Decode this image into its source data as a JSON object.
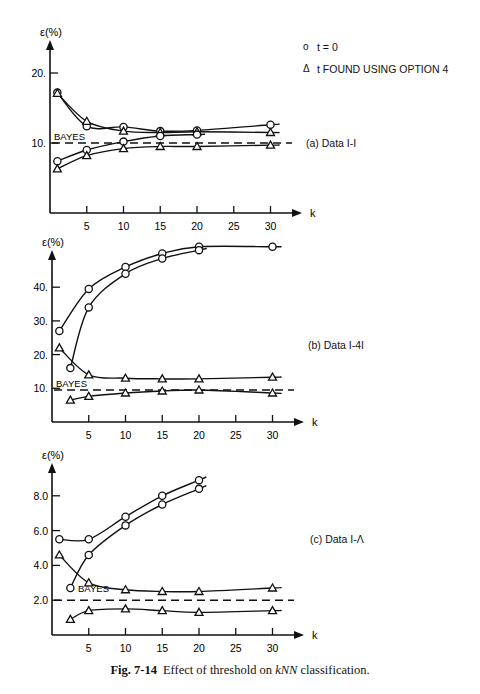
{
  "legend": {
    "items": [
      {
        "symbol": "o",
        "label": "t = 0"
      },
      {
        "symbol": "Δ",
        "label": "t FOUND USING OPTION 4"
      }
    ]
  },
  "caption": {
    "fig": "Fig. 7-14",
    "text_before": "Effect of threshold on ",
    "text_italic": "kNN",
    "text_after": " classification."
  },
  "chart_data": [
    {
      "type": "line",
      "title": "(a) Data I-I",
      "xlabel": "k",
      "ylabel": "ε(%)",
      "xticks": [
        5,
        10,
        15,
        20,
        25,
        30
      ],
      "yticks": [
        10,
        20
      ],
      "ytick_labels": [
        "10.",
        "20."
      ],
      "xlim": [
        0,
        32
      ],
      "ylim": [
        0,
        24
      ],
      "bayes": {
        "label": "BAYES",
        "value": 10
      },
      "grid": false,
      "series": [
        {
          "name": "t = 0 (upper)",
          "marker": "circle",
          "x": [
            1,
            5,
            10,
            15,
            20,
            30
          ],
          "y": [
            17.2,
            12.4,
            12.3,
            11.7,
            11.8,
            12.6
          ]
        },
        {
          "name": "t FOUND USING OPTION 4 (upper)",
          "marker": "triangle",
          "x": [
            1,
            5,
            10,
            15,
            20,
            30
          ],
          "y": [
            17.1,
            13.1,
            11.7,
            11.5,
            11.6,
            11.5
          ]
        },
        {
          "name": "t = 0 (lower)",
          "marker": "circle",
          "x": [
            1,
            5,
            10,
            15,
            20
          ],
          "y": [
            7.4,
            9.0,
            10.2,
            11.0,
            11.2
          ]
        },
        {
          "name": "t FOUND USING OPTION 4 (lower)",
          "marker": "triangle",
          "x": [
            1,
            5,
            10,
            15,
            20,
            30
          ],
          "y": [
            6.3,
            8.2,
            9.2,
            9.5,
            9.5,
            9.7
          ]
        }
      ]
    },
    {
      "type": "line",
      "title": "(b) Data I-4I",
      "xlabel": "k",
      "ylabel": "ε(%)",
      "xticks": [
        5,
        10,
        15,
        20,
        25,
        30
      ],
      "yticks": [
        10,
        20,
        30,
        40
      ],
      "ytick_labels": [
        "10.",
        "20.",
        "30.",
        "40."
      ],
      "xlim": [
        0,
        32
      ],
      "ylim": [
        0,
        56
      ],
      "bayes": {
        "label": "BAYES",
        "value": 9.5
      },
      "grid": false,
      "series": [
        {
          "name": "t = 0 (upper)",
          "marker": "circle",
          "x": [
            1,
            5,
            10,
            15,
            20,
            30
          ],
          "y": [
            27,
            39.5,
            46,
            50,
            52,
            52
          ]
        },
        {
          "name": "t = 0 (lower)",
          "marker": "circle",
          "x": [
            2.5,
            5,
            10,
            15,
            20
          ],
          "y": [
            16,
            34,
            44,
            48.5,
            51
          ]
        },
        {
          "name": "t FOUND USING OPTION 4 (upper)",
          "marker": "triangle",
          "x": [
            1,
            5,
            10,
            15,
            20,
            30
          ],
          "y": [
            22,
            14,
            13,
            12.8,
            12.8,
            13.3
          ]
        },
        {
          "name": "t FOUND USING OPTION 4 (lower)",
          "marker": "triangle",
          "x": [
            2.5,
            5,
            10,
            15,
            20,
            30
          ],
          "y": [
            6.5,
            7.6,
            8.6,
            9.2,
            9.5,
            8.6
          ]
        }
      ]
    },
    {
      "type": "line",
      "title": "(c) Data I-Λ",
      "xlabel": "k",
      "ylabel": "ε(%)",
      "xticks": [
        5,
        10,
        15,
        20,
        25,
        30
      ],
      "yticks": [
        2,
        4,
        6,
        8
      ],
      "ytick_labels": [
        "2.0",
        "4.0",
        "6.0",
        "8.0"
      ],
      "xlim": [
        0,
        32
      ],
      "ylim": [
        0,
        9.6
      ],
      "bayes": {
        "label": "BAYES",
        "value": 2.0
      },
      "grid": false,
      "series": [
        {
          "name": "t = 0 (upper)",
          "marker": "circle",
          "x": [
            1,
            5,
            10,
            15,
            20
          ],
          "y": [
            5.5,
            5.5,
            6.8,
            8.0,
            8.9
          ]
        },
        {
          "name": "t = 0 (lower)",
          "marker": "circle",
          "x": [
            2.5,
            5,
            10,
            15,
            20
          ],
          "y": [
            2.7,
            4.6,
            6.3,
            7.5,
            8.4
          ]
        },
        {
          "name": "t FOUND USING OPTION 4 (upper)",
          "marker": "triangle",
          "x": [
            1,
            5,
            10,
            15,
            20,
            30
          ],
          "y": [
            4.6,
            3.0,
            2.6,
            2.5,
            2.5,
            2.7
          ]
        },
        {
          "name": "t FOUND USING OPTION 4 (lower)",
          "marker": "triangle",
          "x": [
            2.5,
            5,
            10,
            15,
            20,
            30
          ],
          "y": [
            0.9,
            1.4,
            1.5,
            1.4,
            1.3,
            1.4
          ]
        }
      ]
    }
  ]
}
